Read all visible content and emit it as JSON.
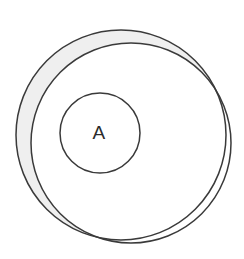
{
  "figure": {
    "background_color": "#ffffff",
    "stroke_color": "#3a3a3a",
    "shade_color": "#efefef",
    "label_color": "#2b2b2b",
    "labels": [
      {
        "text": "A",
        "x": 99,
        "y": 134
      }
    ],
    "circles": [
      {
        "name": "outer-circle",
        "cx": 121,
        "cy": 135,
        "r": 105,
        "stroke_width": 1.5
      },
      {
        "name": "medium-circle",
        "cx": 131,
        "cy": 143,
        "r": 100,
        "stroke_width": 1.5
      },
      {
        "name": "inner-circle",
        "cx": 100,
        "cy": 133,
        "r": 40,
        "stroke_width": 1.5
      }
    ],
    "shaded_region": {
      "name": "crescent-outer-minus-medium",
      "description": "Area inside the outer circle but outside the medium circle",
      "fill": "#efefef"
    }
  }
}
